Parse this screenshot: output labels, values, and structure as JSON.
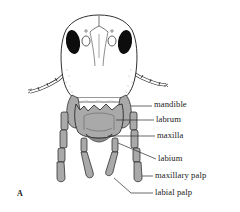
{
  "figure": {
    "panel_letter": "A",
    "colors": {
      "outline": "#1a1a1a",
      "head_fill": "#ffffff",
      "mouthpart_fill": "#a9a9a9",
      "mouthpart_shade": "#8c8c8c",
      "eye_fill": "#0d0d0d",
      "leader_line": "#2a2a2a"
    },
    "labels": [
      {
        "id": "mandible",
        "text": "mandible"
      },
      {
        "id": "labrum",
        "text": "labrum"
      },
      {
        "id": "maxilla",
        "text": "maxilla"
      },
      {
        "id": "labium",
        "text": "labium"
      },
      {
        "id": "maxillary-palp",
        "text": "maxillary palp"
      },
      {
        "id": "labial-palp",
        "text": "labial palp"
      }
    ]
  }
}
